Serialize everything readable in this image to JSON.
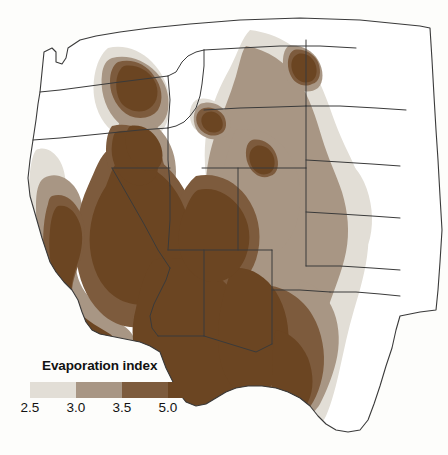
{
  "figure": {
    "type": "choropleth-contour-map",
    "region": "Western United States",
    "background_color": "#fdfdfb",
    "border_color": "#3a3a3a"
  },
  "legend": {
    "title": "Evaporation index",
    "swatches": [
      {
        "name": "class-2.5-3.0",
        "color": "#e2ded6"
      },
      {
        "name": "class-3.0-3.5",
        "color": "#a89684"
      },
      {
        "name": "class-3.5-5.0",
        "color": "#7d5b3d"
      },
      {
        "name": "class-5.0-plus",
        "color": "#6b4522"
      }
    ],
    "labels": [
      "2.5",
      "3.0",
      "3.5",
      "5.0"
    ],
    "label_positions_pct": [
      0,
      25,
      50,
      75
    ]
  },
  "chart_data": {
    "type": "heatmap",
    "title": "Evaporation index",
    "xlabel": "",
    "ylabel": "",
    "legend_position": "bottom-left",
    "grid": false,
    "colorbar": {
      "ticks": [
        2.5,
        3.0,
        3.5,
        5.0
      ],
      "colors": [
        "#e2ded6",
        "#a89684",
        "#7d5b3d",
        "#6b4522"
      ],
      "classes": [
        {
          "range": "2.5-3.0",
          "color": "#e2ded6"
        },
        {
          "range": "3.0-3.5",
          "color": "#a89684"
        },
        {
          "range": "3.5-5.0",
          "color": "#7d5b3d"
        },
        {
          "range": "5.0+",
          "color": "#6b4522"
        }
      ]
    },
    "regions": [
      {
        "name": "Washington",
        "dominant_class": "2.5-3.0",
        "note": "mostly unshaded, small 5.0+ pocket in south-central"
      },
      {
        "name": "Oregon",
        "dominant_class": "3.5-5.0",
        "note": "north-central dark pocket, southeast broad 5.0+"
      },
      {
        "name": "Idaho",
        "dominant_class": "3.5-5.0",
        "note": "southern plain heavily shaded"
      },
      {
        "name": "Montana",
        "dominant_class": "3.0-3.5",
        "note": "isolated 5.0+ pockets in east"
      },
      {
        "name": "Wyoming",
        "dominant_class": "3.0-3.5"
      },
      {
        "name": "Nevada",
        "dominant_class": "5.0+"
      },
      {
        "name": "California",
        "dominant_class": "5.0+",
        "note": "Central Valley dark, coast light"
      },
      {
        "name": "Utah",
        "dominant_class": "3.5-5.0"
      },
      {
        "name": "Colorado",
        "dominant_class": "3.0-3.5"
      },
      {
        "name": "Arizona",
        "dominant_class": "5.0+"
      },
      {
        "name": "New Mexico",
        "dominant_class": "5.0+"
      },
      {
        "name": "North Dakota",
        "dominant_class": "below-2.5"
      },
      {
        "name": "South Dakota",
        "dominant_class": "2.5-3.0"
      },
      {
        "name": "Nebraska",
        "dominant_class": "2.5-3.0"
      },
      {
        "name": "Kansas",
        "dominant_class": "2.5-3.0"
      },
      {
        "name": "Oklahoma",
        "dominant_class": "3.0-3.5"
      },
      {
        "name": "Texas",
        "dominant_class": "3.5-5.0"
      }
    ]
  }
}
